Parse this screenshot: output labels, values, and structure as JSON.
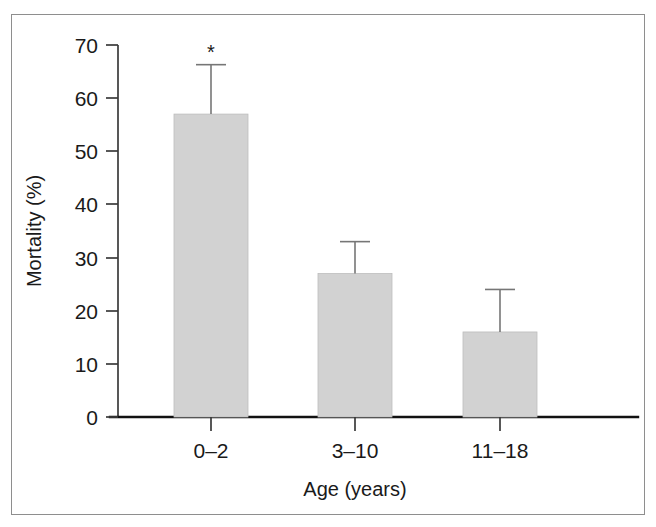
{
  "figure": {
    "background_color": "#ffffff",
    "frame_color": "#8e8e8e",
    "bar_fill_color": "#d2d2d2",
    "axis_color": "#111111",
    "text_color": "#1a1a1a",
    "significance_marker": "*"
  },
  "chart_data": {
    "type": "bar",
    "title": "",
    "subtitle": "",
    "xlabel": "Age (years)",
    "ylabel": "Mortality (%)",
    "categories": [
      "0–2",
      "3–10",
      "11–18"
    ],
    "values": [
      57,
      27,
      16
    ],
    "errors_upper": [
      9.3,
      6,
      8
    ],
    "error_tops": [
      66.3,
      33,
      24
    ],
    "annotations": [
      {
        "category": "0–2",
        "text": "*",
        "meaning": "significant"
      }
    ],
    "ylim": [
      0,
      70
    ],
    "yticks": [
      0,
      10,
      20,
      30,
      40,
      50,
      60,
      70
    ],
    "ytick_labels": [
      "0",
      "10",
      "20",
      "30",
      "40",
      "50",
      "60",
      "70"
    ],
    "xtick_labels": [
      "0–2",
      "3–10",
      "11–18"
    ],
    "grid": false,
    "legend": null,
    "legend_position": "none",
    "error_bar_style": "upper-only-with-cap"
  }
}
